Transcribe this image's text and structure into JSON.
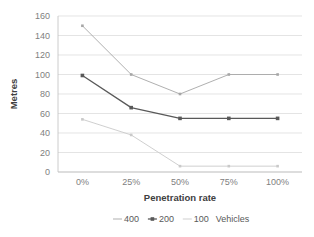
{
  "chart_data": {
    "type": "line",
    "title": "",
    "xlabel": "Penetration rate",
    "ylabel": "Metres",
    "categories": [
      "0%",
      "25%",
      "50%",
      "75%",
      "100%"
    ],
    "x_tick_labels": [
      "0%",
      "25%",
      "50%",
      "75%",
      "100%"
    ],
    "y_tick_labels": [
      "0",
      "20",
      "40",
      "60",
      "80",
      "100",
      "120",
      "140",
      "160"
    ],
    "ylim": [
      0,
      160
    ],
    "ytick_step": 20,
    "grid": true,
    "legend_position": "bottom",
    "legend_suffix": "Vehicles",
    "series": [
      {
        "name": "400",
        "label": "400",
        "color": "#a6a6a6",
        "marker": "dash",
        "values": [
          150,
          100,
          80,
          100,
          100
        ]
      },
      {
        "name": "200",
        "label": "200",
        "color": "#595959",
        "marker": "square",
        "values": [
          99,
          66,
          55,
          55,
          55
        ]
      },
      {
        "name": "100",
        "label": "100",
        "color": "#c9c9c9",
        "marker": "line",
        "values": [
          54,
          38,
          6,
          6,
          6
        ]
      }
    ]
  },
  "axis": {
    "y_title": "Metres",
    "x_title": "Penetration rate"
  },
  "legend": {
    "items": [
      {
        "label": "400"
      },
      {
        "label": "200"
      },
      {
        "label": "100"
      }
    ],
    "suffix": "Vehicles"
  }
}
